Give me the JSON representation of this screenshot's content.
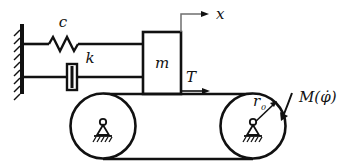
{
  "figure": {
    "background_color": "#ffffff",
    "line_color": "#111111"
  },
  "labels": {
    "spring_element": "c",
    "damper_element": "k",
    "mass_block": "m",
    "belt_tension": "T",
    "displacement_axis": "x",
    "pulley_radius": "r",
    "pulley_radius_subscript": "0",
    "applied_moment": "M(φ̇)"
  },
  "components": {
    "wall": {
      "name": "fixed-wall",
      "hatch_count": 9
    },
    "spring": {
      "name": "spring-zigzag",
      "peaks": 3
    },
    "damper": {
      "name": "dashpot-box"
    },
    "mass": {
      "name": "mass-block"
    },
    "belt": {
      "name": "belt-loop"
    },
    "pulley_left": {
      "name": "left-pulley",
      "support": "pin-support"
    },
    "pulley_right": {
      "name": "right-pulley",
      "support": "pin-support"
    },
    "moment_arrow": {
      "name": "curved-moment-arrow",
      "direction": "clockwise"
    },
    "x_arrow": {
      "name": "x-axis-arrow",
      "direction": "right"
    },
    "t_arrow": {
      "name": "tension-arrow",
      "direction": "right"
    }
  }
}
